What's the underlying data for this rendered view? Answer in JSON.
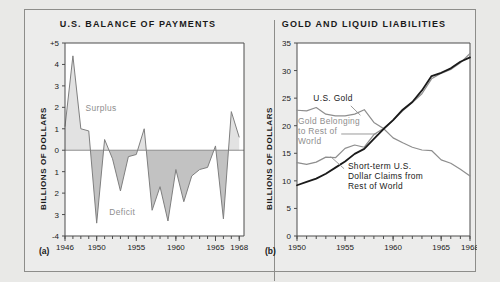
{
  "figure": {
    "background": "#e9e9e7",
    "panel_background": "#ececeb"
  },
  "panel_a": {
    "letter": "(a)",
    "title": "U.S. BALANCE OF PAYMENTS",
    "ylabel": "BILLIONS OF DOLLARS",
    "surplus_label": "Surplus",
    "deficit_label": "Deficit",
    "ytick_labels": [
      "+5",
      "4",
      "3",
      "2",
      "1",
      "0",
      "1",
      "2",
      "3",
      "-4"
    ],
    "xtick_labels": [
      "1946",
      "1950",
      "1955",
      "1960",
      "1965",
      "1968"
    ]
  },
  "panel_b": {
    "letter": "(b)",
    "title": "GOLD AND LIQUID LIABILITIES",
    "ylabel": "BILLIONS OF DOLLARS",
    "ytick_labels": [
      "35",
      "30",
      "25",
      "20",
      "15",
      "10",
      "5",
      "0"
    ],
    "xtick_labels": [
      "1950",
      "1955",
      "1960",
      "1965",
      "1968"
    ],
    "ann_us_gold": "U.S. Gold",
    "ann_gold_rest_1": "Gold Belonging",
    "ann_gold_rest_2": "to Rest of",
    "ann_gold_rest_3": "World",
    "ann_claims_1": "Short-term U.S.",
    "ann_claims_2": "Dollar Claims from",
    "ann_claims_3": "Rest of World"
  },
  "colors": {
    "line_gray": "#8e8e8e",
    "line_black": "#1a1a1a",
    "fill_surplus": "#e2e2e2",
    "fill_deficit": "#c2c2c2",
    "axis": "#4d4d4d"
  },
  "chart_data": [
    {
      "type": "area",
      "id": "panel_a",
      "title": "U.S. BALANCE OF PAYMENTS",
      "xlabel": "",
      "ylabel": "BILLIONS OF DOLLARS",
      "xlim": [
        1946,
        1968.6
      ],
      "ylim": [
        -4,
        5
      ],
      "grid": false,
      "legend": "none",
      "annotations": [
        "Surplus",
        "Deficit"
      ],
      "series": [
        {
          "name": "U.S. Balance of Payments",
          "x": [
            1946,
            1947,
            1948,
            1949,
            1950,
            1951,
            1952,
            1953,
            1954,
            1955,
            1956,
            1957,
            1958,
            1959,
            1960,
            1961,
            1962,
            1963,
            1964,
            1965,
            1966,
            1967,
            1968
          ],
          "values": [
            1.1,
            4.4,
            1.0,
            0.9,
            -3.4,
            0.5,
            -0.4,
            -1.9,
            -0.3,
            -0.2,
            1.0,
            -2.8,
            -1.7,
            -3.3,
            -0.9,
            -2.4,
            -1.2,
            -0.9,
            -0.8,
            0.2,
            -3.2,
            1.8,
            0.6
          ]
        }
      ]
    },
    {
      "type": "line",
      "id": "panel_b",
      "title": "GOLD AND LIQUID LIABILITIES",
      "xlabel": "",
      "ylabel": "BILLIONS OF DOLLARS",
      "xlim": [
        1950,
        1968
      ],
      "ylim": [
        0,
        35
      ],
      "grid": false,
      "legend": "inline-annotations",
      "series": [
        {
          "name": "U.S. Gold",
          "color": "#8e8e8e",
          "x": [
            1950,
            1951,
            1952,
            1953,
            1954,
            1955,
            1956,
            1957,
            1958,
            1959,
            1960,
            1961,
            1962,
            1963,
            1964,
            1965,
            1966,
            1967,
            1968
          ],
          "values": [
            22.8,
            22.7,
            23.3,
            22.1,
            21.8,
            21.8,
            22.1,
            22.9,
            20.6,
            19.5,
            17.8,
            16.9,
            16.1,
            15.6,
            15.5,
            13.8,
            13.2,
            12.1,
            10.9
          ]
        },
        {
          "name": "Gold Belonging to Rest of World",
          "color": "#8e8e8e",
          "x": [
            1950,
            1951,
            1952,
            1953,
            1954,
            1955,
            1956,
            1957,
            1958,
            1959,
            1960,
            1961,
            1962,
            1963,
            1964,
            1965,
            1966,
            1967,
            1968
          ],
          "values": [
            13.3,
            13.0,
            13.4,
            14.3,
            14.2,
            15.9,
            16.5,
            16.1,
            18.4,
            19.5,
            21.0,
            22.7,
            24.2,
            25.8,
            28.5,
            29.5,
            30.2,
            31.4,
            33.1
          ]
        },
        {
          "name": "Short-term U.S. Dollar Claims from Rest of World",
          "color": "#1a1a1a",
          "x": [
            1950,
            1951,
            1952,
            1953,
            1954,
            1955,
            1956,
            1957,
            1958,
            1959,
            1960,
            1961,
            1962,
            1963,
            1964,
            1965,
            1966,
            1967,
            1968
          ],
          "values": [
            9.2,
            9.8,
            10.4,
            11.3,
            12.4,
            13.5,
            14.9,
            15.8,
            17.6,
            19.4,
            21.0,
            22.9,
            24.3,
            26.4,
            29.0,
            29.6,
            30.4,
            31.6,
            32.4
          ]
        }
      ]
    }
  ]
}
